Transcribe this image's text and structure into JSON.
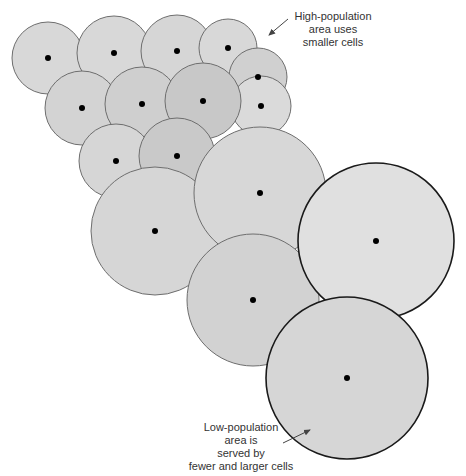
{
  "diagram": {
    "colors": {
      "background": "#ffffff",
      "small_cell_fill_light": "#d9d9d9",
      "small_cell_fill_mid": "#cfcfcf",
      "small_cell_fill_dark": "#c6c6c6",
      "small_cell_stroke": "#6e6e6e",
      "large_cell_stroke": "#1a1a1a",
      "dot": "#000000",
      "text": "#333333",
      "arrow": "#444444"
    },
    "cells": [
      {
        "id": "cell-1",
        "cx": 48,
        "cy": 58,
        "r": 36,
        "fill": "#d8d8d8",
        "stroke": "#6e6e6e",
        "stroke_width": 1
      },
      {
        "id": "cell-2",
        "cx": 114,
        "cy": 53,
        "r": 37,
        "fill": "#d8d8d8",
        "stroke": "#6e6e6e",
        "stroke_width": 1
      },
      {
        "id": "cell-3",
        "cx": 177,
        "cy": 51,
        "r": 36,
        "fill": "#d6d6d6",
        "stroke": "#6e6e6e",
        "stroke_width": 1
      },
      {
        "id": "cell-4",
        "cx": 228,
        "cy": 48,
        "r": 29,
        "fill": "#d8d8d8",
        "stroke": "#6e6e6e",
        "stroke_width": 1
      },
      {
        "id": "cell-5",
        "cx": 258,
        "cy": 77,
        "r": 29,
        "fill": "#d0d0d0",
        "stroke": "#6e6e6e",
        "stroke_width": 1
      },
      {
        "id": "cell-6",
        "cx": 261,
        "cy": 106,
        "r": 30,
        "fill": "#dadada",
        "stroke": "#6e6e6e",
        "stroke_width": 1
      },
      {
        "id": "cell-7",
        "cx": 82,
        "cy": 108,
        "r": 37,
        "fill": "#d3d3d3",
        "stroke": "#6e6e6e",
        "stroke_width": 1
      },
      {
        "id": "cell-8",
        "cx": 142,
        "cy": 104,
        "r": 37,
        "fill": "#cfcfcf",
        "stroke": "#6e6e6e",
        "stroke_width": 1
      },
      {
        "id": "cell-9",
        "cx": 203,
        "cy": 101,
        "r": 38,
        "fill": "#c8c8c8",
        "stroke": "#6e6e6e",
        "stroke_width": 1
      },
      {
        "id": "cell-10",
        "cx": 116,
        "cy": 161,
        "r": 37,
        "fill": "#d6d6d6",
        "stroke": "#6e6e6e",
        "stroke_width": 1
      },
      {
        "id": "cell-11",
        "cx": 177,
        "cy": 156,
        "r": 38,
        "fill": "#c9c9c9",
        "stroke": "#6e6e6e",
        "stroke_width": 1
      },
      {
        "id": "cell-12",
        "cx": 155,
        "cy": 231,
        "r": 64,
        "fill": "#d6d6d6",
        "stroke": "#6e6e6e",
        "stroke_width": 1
      },
      {
        "id": "cell-13",
        "cx": 260,
        "cy": 193,
        "r": 66,
        "fill": "#d7d7d7",
        "stroke": "#6e6e6e",
        "stroke_width": 1
      },
      {
        "id": "cell-14",
        "cx": 253,
        "cy": 300,
        "r": 66,
        "fill": "#d2d2d2",
        "stroke": "#6e6e6e",
        "stroke_width": 1
      },
      {
        "id": "cell-15",
        "cx": 376,
        "cy": 241,
        "r": 78,
        "fill": "#e0e0e0",
        "stroke": "#1a1a1a",
        "stroke_width": 1.6
      },
      {
        "id": "cell-16",
        "cx": 347,
        "cy": 378,
        "r": 81,
        "fill": "#d6d6d6",
        "stroke": "#1a1a1a",
        "stroke_width": 1.6
      }
    ],
    "dot_radius": 3,
    "annotations": [
      {
        "id": "high-population",
        "lines": [
          "High-population",
          "area uses",
          "smaller cells"
        ],
        "arrow": {
          "x1": 288,
          "y1": 19,
          "x2": 269,
          "y2": 35
        }
      },
      {
        "id": "low-population",
        "lines": [
          "Low-population",
          "area is",
          "served by",
          "fewer and larger cells"
        ],
        "arrow": {
          "x1": 283,
          "y1": 443,
          "x2": 310,
          "y2": 430
        }
      }
    ]
  }
}
